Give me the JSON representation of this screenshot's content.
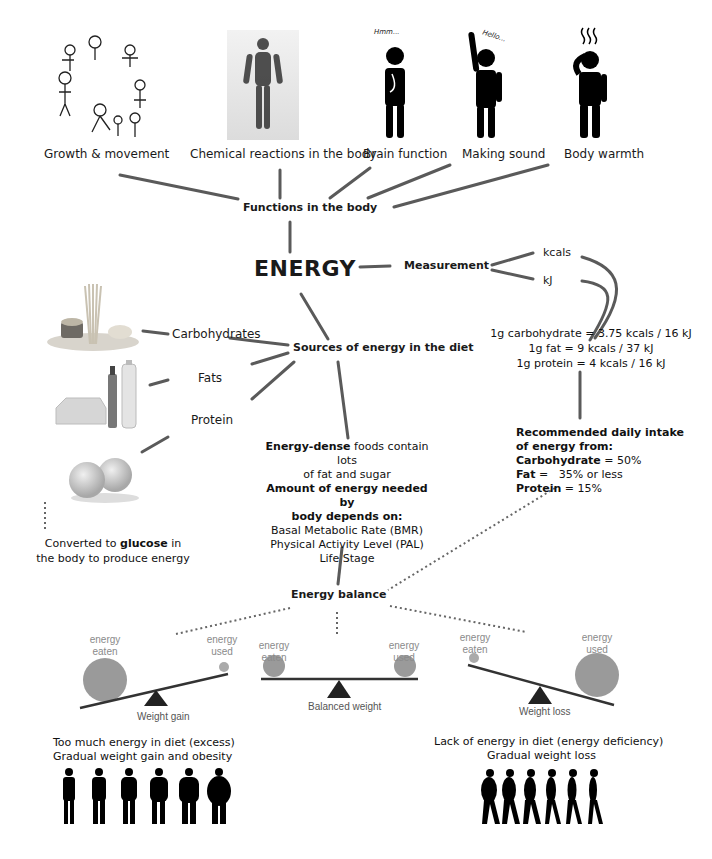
{
  "functions": {
    "heading": "Functions in the body",
    "items": [
      {
        "label": "Growth & movement",
        "icon": "growth-cycle-icon"
      },
      {
        "label": "Chemical reactions in the body",
        "icon": "particle-body-icon"
      },
      {
        "label": "Brain function",
        "icon": "thinking-person-icon",
        "bubble": "Hmm..."
      },
      {
        "label": "Making sound",
        "icon": "waving-person-icon",
        "bubble": "Hello..."
      },
      {
        "label": "Body warmth",
        "icon": "hot-person-icon"
      }
    ]
  },
  "center": {
    "title": "ENERGY"
  },
  "measurement": {
    "heading": "Measurement",
    "units": [
      "kcals",
      "kJ"
    ],
    "conversions": [
      "1g carbohydrate = 3.75 kcals / 16 kJ",
      "1g fat = 9 kcals / 37 kJ",
      "1g protein = 4 kcals / 16 kJ"
    ]
  },
  "recommended": {
    "heading_line1": "Recommended daily intake",
    "heading_line2": "of energy from:",
    "rows": [
      {
        "label": "Carbohydrate",
        "value": " = 50%"
      },
      {
        "label": "Fat",
        "value": " =   35% or less"
      },
      {
        "label": "Protein",
        "value": " = 15%"
      }
    ]
  },
  "sources": {
    "heading": "Sources of energy in the diet",
    "items": [
      {
        "label": "Carbohydrates",
        "icon": "pasta-icon"
      },
      {
        "label": "Fats",
        "icon": "oil-butter-icon"
      },
      {
        "label": "Protein",
        "icon": "eggs-icon"
      }
    ],
    "glucose_pre": "Converted to ",
    "glucose_bold": "glucose",
    "glucose_post": " in",
    "glucose_line2": "the body to produce energy"
  },
  "needs": {
    "dense_bold": "Energy-dense",
    "dense_rest": " foods contain lots",
    "dense_line2": "of fat and sugar",
    "amount_line1": "Amount of energy needed by",
    "amount_line2": "body depends on:",
    "factors": [
      "Basal Metabolic Rate (BMR)",
      "Physical Activity Level (PAL)",
      "Life Stage"
    ]
  },
  "balance": {
    "heading": "Energy balance",
    "scales": [
      {
        "caption": "Weight gain",
        "left_label": "energy\neaten",
        "right_label": "energy\nused"
      },
      {
        "caption": "Balanced weight",
        "left_label": "energy\neaten",
        "right_label": "energy\nused"
      },
      {
        "caption": "Weight loss",
        "left_label": "energy\neaten",
        "right_label": "energy\nused"
      }
    ],
    "excess_line1": "Too much energy in diet (excess)",
    "excess_line2": "Gradual weight gain and obesity",
    "deficit_line1": "Lack of energy in diet (energy deficiency)",
    "deficit_line2": "Gradual weight loss"
  },
  "colors": {
    "line": "#555555",
    "ball": "#9a9a9a",
    "text": "#1a1a1a",
    "dot": "#666666"
  }
}
